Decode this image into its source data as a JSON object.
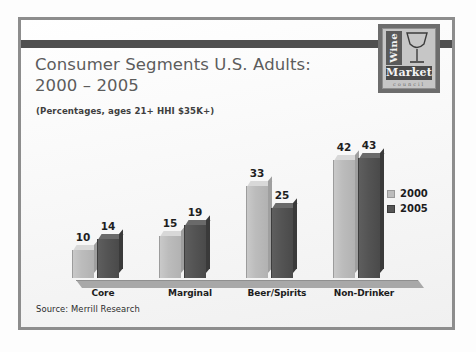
{
  "slide": {
    "title_line1": "Consumer Segments U.S. Adults:",
    "title_line2": "2000 – 2005",
    "subtitle": "(Percentages, ages 21+ HHI $35K+)",
    "source": "Source: Merrill Research"
  },
  "logo": {
    "word_vertical": "Wine",
    "word_main": "Market",
    "word_sub": "council",
    "icon": "wine-glass-icon"
  },
  "colors": {
    "series_2000": "#bcbcbc",
    "series_2005": "#545454",
    "frame": "#8d8d8d",
    "band": "#4f4f4f",
    "title_text": "#5c5c5c",
    "label_text": "#1f1f1f"
  },
  "chart_data": {
    "type": "bar",
    "title": "Consumer Segments U.S. Adults: 2000 – 2005",
    "subtitle": "(Percentages, ages 21+ HHI $35K+)",
    "xlabel": "",
    "ylabel": "",
    "ylim": [
      0,
      50
    ],
    "grid": false,
    "legend_position": "right",
    "source": "Source: Merrill Research",
    "categories": [
      "Core",
      "Marginal",
      "Beer/Spirits",
      "Non-Drinker"
    ],
    "series": [
      {
        "name": "2000",
        "color": "#bcbcbc",
        "values": [
          10,
          15,
          33,
          42
        ]
      },
      {
        "name": "2005",
        "color": "#545454",
        "values": [
          14,
          19,
          25,
          43
        ]
      }
    ]
  }
}
